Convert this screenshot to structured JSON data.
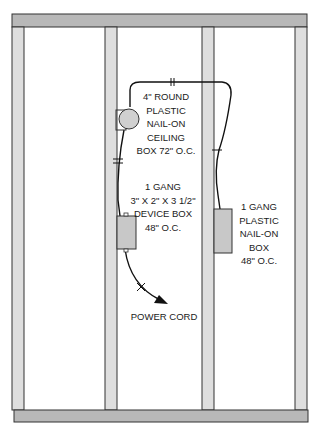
{
  "diagram": {
    "type": "wall framing electrical layout",
    "colors": {
      "plate": "#b4b4b4",
      "stud": "#dcdcdc",
      "box": "#c8c8c8",
      "outline": "#333333",
      "cable": "#111111"
    },
    "labels": {
      "ceiling_box": [
        "4\" ROUND",
        "PLASTIC",
        "NAIL-ON",
        "CEILING",
        "BOX 72\" O.C."
      ],
      "device_box": [
        "1 GANG",
        "3\" X 2\" X 3 1/2\"",
        "DEVICE BOX",
        "48\" O.C."
      ],
      "plastic_box": [
        "1 GANG",
        "PLASTIC",
        "NAIL-ON",
        "BOX",
        "48\" O.C."
      ],
      "power_cord": "POWER CORD"
    }
  }
}
